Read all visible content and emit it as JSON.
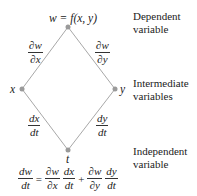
{
  "diagram": {
    "nodes": {
      "top": {
        "label": "w = f(x, y)"
      },
      "left": {
        "label": "x"
      },
      "right": {
        "label": "y"
      },
      "bottom": {
        "label": "t"
      }
    },
    "edges": {
      "top_left": {
        "num": "∂w",
        "den": "∂x"
      },
      "top_right": {
        "num": "∂w",
        "den": "∂y"
      },
      "left_bottom": {
        "num": "dx",
        "den": "dt"
      },
      "right_bottom": {
        "num": "dy",
        "den": "dt"
      }
    },
    "side_labels": {
      "dependent": [
        "Dependent",
        "variable"
      ],
      "intermediate": [
        "Intermediate",
        "variables"
      ],
      "independent": [
        "Independent",
        "variable"
      ]
    },
    "formula": {
      "lhs": {
        "num": "dw",
        "den": "dt"
      },
      "eq": "=",
      "t1a": {
        "num": "∂w",
        "den": "∂x"
      },
      "t1b": {
        "num": "dx",
        "den": "dt"
      },
      "plus": "+",
      "t2a": {
        "num": "∂w",
        "den": "∂y"
      },
      "t2b": {
        "num": "dy",
        "den": "dt"
      }
    },
    "colors": {
      "line": "#a8a8a8",
      "node": "#9a9a9a",
      "text": "#222222"
    }
  }
}
